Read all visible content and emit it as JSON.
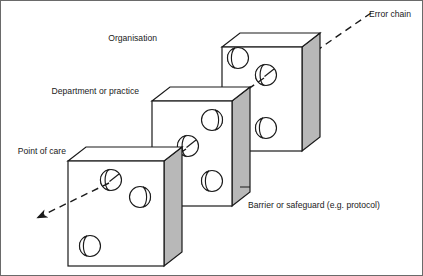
{
  "figure": {
    "type": "swiss-cheese-model-diagram",
    "title": "",
    "background_color": "#ffffff",
    "line_color": "#1a1a1a",
    "slab_face_color": "#ffffff",
    "slab_side_color": "#b8b8b8",
    "slab_top_color": "#ffffff",
    "border_color": "#6a6a6a"
  },
  "labels": {
    "organisation": "Organisation",
    "department": "Department or practice",
    "point_of_care": "Point of care",
    "error_chain": "Error chain",
    "barrier": "Barrier or safeguard (e.g. protocol)"
  },
  "layers": [
    {
      "id": "organisation",
      "label": "Organisation",
      "label_anchor": "left",
      "order": 3,
      "holes": 3,
      "pierced_holes": 1
    },
    {
      "id": "department-or-practice",
      "label": "Department or practice",
      "label_anchor": "left",
      "order": 2,
      "holes": 3,
      "pierced_holes": 1
    },
    {
      "id": "point-of-care",
      "label": "Point of care",
      "label_anchor": "left",
      "order": 1,
      "holes": 3,
      "pierced_holes": 1
    }
  ],
  "annotations": {
    "error_chain_direction": "from upper-right to lower-left",
    "arrow_style": "dashed with arrowhead",
    "barrier_label_target": "slab-side-face"
  }
}
